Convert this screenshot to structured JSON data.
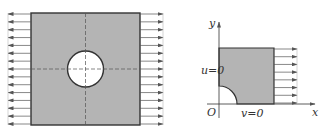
{
  "figure": {
    "left_panel": {
      "description": "Square plate with central circular hole under uniaxial tension",
      "plate": {
        "x": 31,
        "y": 13,
        "width": 109,
        "height": 112,
        "fill": "#b4b4b4",
        "stroke": "#333333"
      },
      "hole": {
        "cx": 85.5,
        "cy": 69,
        "r": 18,
        "fill": "#ffffff"
      },
      "centerlines": {
        "dashed": true
      },
      "arrows_left": {
        "count": 15,
        "x_from": 31,
        "x_to": 8,
        "direction": "left"
      },
      "arrows_right": {
        "count": 15,
        "x_from": 140,
        "x_to": 163,
        "direction": "right"
      }
    },
    "right_panel": {
      "description": "Quarter model with symmetry boundary conditions",
      "axes": {
        "origin_label": "O",
        "x_label": "x",
        "y_label": "y"
      },
      "quarter_plate": {
        "x": 219,
        "y": 48,
        "width": 55,
        "height": 56,
        "fill": "#b4b4b4"
      },
      "quarter_hole_radius": 18,
      "bc_left": "u=0",
      "bc_bottom": "v=0",
      "arrows_right": {
        "count": 8,
        "x_from": 274,
        "x_to": 297,
        "direction": "right"
      }
    }
  },
  "colors": {
    "plate_fill": "#b4b4b4",
    "stroke": "#333333",
    "arrow": "#555555"
  }
}
